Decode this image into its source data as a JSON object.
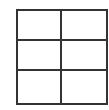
{
  "grid": {
    "rows": 3,
    "columns": 2,
    "line_color": "#333333",
    "background": "#ffffff",
    "cells": [
      [
        "",
        ""
      ],
      [
        "",
        ""
      ],
      [
        "",
        ""
      ]
    ]
  }
}
